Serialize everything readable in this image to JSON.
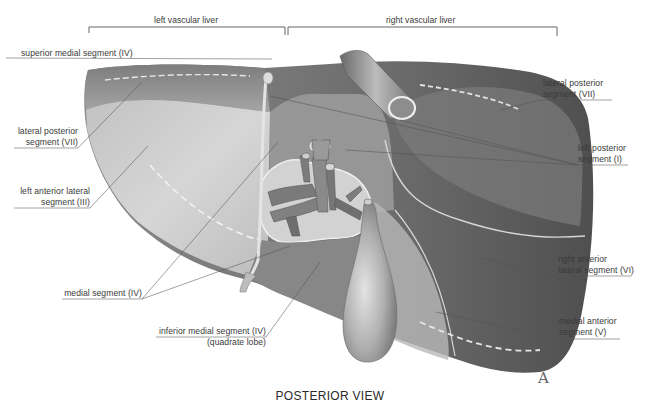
{
  "brackets": {
    "left": {
      "label": "left vascular liver"
    },
    "right": {
      "label": "right vascular liver"
    }
  },
  "labels_left": [
    {
      "id": "superior-medial-segment",
      "line1": "superior medial segment (IV)",
      "line2": ""
    },
    {
      "id": "lateral-posterior-segment-left",
      "line1": "lateral posterior",
      "line2": "segment (VII)"
    },
    {
      "id": "left-anterior-lateral-segment",
      "line1": "left anterior lateral",
      "line2": "segment (III)"
    },
    {
      "id": "medial-segment",
      "line1": "medial segment (IV)",
      "line2": ""
    },
    {
      "id": "inferior-medial-segment",
      "line1": "inferior medial segment (IV)",
      "line2": "(quadrate lobe)"
    }
  ],
  "labels_right": [
    {
      "id": "lateral-posterior-segment-right",
      "line1": "lateral posterior",
      "line2": "segment (VII)"
    },
    {
      "id": "left-posterior-segment",
      "line1": "left posterior",
      "line2": "segment (I)"
    },
    {
      "id": "right-anterior-lateral-segment",
      "line1": "right anterior",
      "line2": "lateral segment (VI)"
    },
    {
      "id": "medial-anterior-segment",
      "line1": "medial anterior",
      "line2": "segment (V)"
    }
  ],
  "view_title": "POSTERIOR VIEW",
  "figure_letter": "A",
  "colors": {
    "background": "#ffffff",
    "leader_line": "#555555",
    "liver_dark": "#6f6f6f",
    "liver_mid": "#8c8c8c",
    "liver_light": "#c9c9c9",
    "text": "#3a3a3a"
  }
}
